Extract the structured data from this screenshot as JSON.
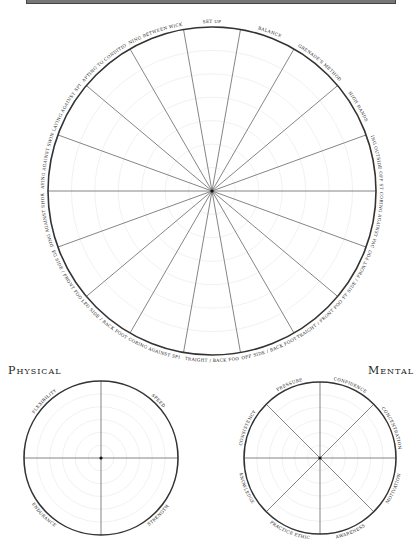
{
  "header_bar": {
    "visible": true
  },
  "main_wheel": {
    "center": [
      212,
      191
    ],
    "radius": 164,
    "rings": 6,
    "segments": [
      "SET UP",
      "BALANCE",
      "GRENADE'S METHOD",
      "HIGH HANDS",
      "LEAVING OUTSIDE OFF STUMP",
      "SCORING AGAINST PACE",
      "OFF SIDE / FRONT FOOT",
      "STRAIGHT / FRONT FOOT",
      "OFF SIDE / BACK FOOT",
      "STRAIGHT / BACK FOOT",
      "SCORING AGAINST SPIN",
      "LEG SIDE / BACK FOOT",
      "LEG SIDE / FRONT FOOT",
      "DEFENDING AGAINST SHORT BALL",
      "PLAYING AGAINST SWING",
      "PLAYING AGAINST SPIN",
      "ADAPTING TO CONDITIONS",
      "RUNNING BETWEEN WICKETS"
    ]
  },
  "physical": {
    "title": "Physical",
    "center": [
      101,
      458
    ],
    "radius": 77,
    "segments": [
      "SPEED",
      "STRENGTH",
      "ENDURANCE",
      "FLEXIBILITY"
    ]
  },
  "mental": {
    "title": "Mental",
    "center": [
      320,
      458
    ],
    "radius": 76,
    "segments": [
      "CONFIDENCE",
      "CONCENTRATION",
      "MOTIVATION",
      "AWARENESS",
      "PRACTICE ETHIC",
      "KNOWLEDGE",
      "CONSISTENCY",
      "PRESSURE"
    ]
  },
  "colors": {
    "line": "#333333",
    "spoke": "#666666",
    "ring": "#eeeeee",
    "text": "#222222"
  }
}
